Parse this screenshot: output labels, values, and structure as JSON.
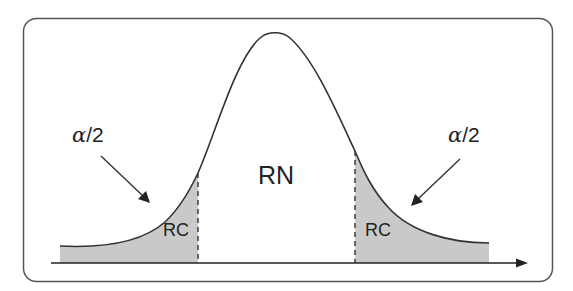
{
  "diagram": {
    "type": "normal-distribution-two-tailed-test",
    "labels": {
      "alpha_left": {
        "greek": "α",
        "rest": "/2"
      },
      "alpha_right": {
        "greek": "α",
        "rest": "/2"
      },
      "acceptance_region": "RN",
      "critical_region_left": "RC",
      "critical_region_right": "RC"
    },
    "colors": {
      "frame": "#555555",
      "curve": "#333333",
      "shade": "#c9c9c9",
      "axis": "#222222",
      "text": "#222222"
    },
    "geometry": {
      "peak": {
        "x": 275,
        "y": 32
      },
      "baseline_y": 263,
      "left_cut_x": 198,
      "right_cut_x": 355,
      "tail_left_x": 60,
      "tail_right_x": 489
    }
  }
}
